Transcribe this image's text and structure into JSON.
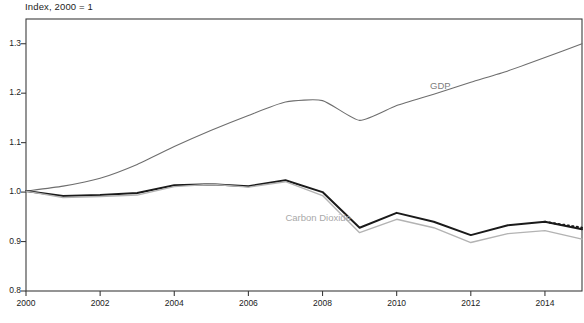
{
  "chart_data": {
    "type": "line",
    "title": "Index, 2000 = 1",
    "xlabel": "",
    "ylabel": "",
    "xlim": [
      2000,
      2015
    ],
    "ylim": [
      0.8,
      1.35
    ],
    "yticks": [
      "0.8",
      "0.9",
      "1.0",
      "1.1",
      "1.2",
      "1.3"
    ],
    "ytick_values": [
      0.8,
      0.9,
      1.0,
      1.1,
      1.2,
      1.3
    ],
    "xticks": [
      "2000",
      "2002",
      "2004",
      "2006",
      "2008",
      "2010",
      "2012",
      "2014"
    ],
    "xtick_values": [
      2000,
      2002,
      2004,
      2006,
      2008,
      2010,
      2012,
      2014
    ],
    "grid": false,
    "legend_position": "inline-annotations",
    "x": [
      2000,
      2001,
      2002,
      2003,
      2004,
      2005,
      2006,
      2007,
      2008,
      2009,
      2010,
      2011,
      2012,
      2013,
      2014,
      2015
    ],
    "series": [
      {
        "name": "GDP",
        "color": "#6e6e6e",
        "width": 1.1,
        "style": "solid",
        "values": [
          1.002,
          1.012,
          1.028,
          1.056,
          1.092,
          1.125,
          1.155,
          1.182,
          1.185,
          1.145,
          1.175,
          1.198,
          1.222,
          1.245,
          1.272,
          1.3
        ]
      },
      {
        "name": "Carbon Dioxide",
        "color": "#1a1a1a",
        "width": 2.0,
        "style": "solid",
        "values": [
          1.002,
          0.992,
          0.994,
          0.998,
          1.014,
          1.016,
          1.012,
          1.024,
          1.0,
          0.928,
          0.958,
          0.94,
          0.913,
          0.933,
          0.94,
          0.925
        ],
        "projection": {
          "style": "dotted",
          "from_x": 2014,
          "to_x": 2015,
          "values": [
            0.94,
            0.928
          ]
        }
      },
      {
        "name": "Carbon Dioxide (alternate)",
        "color": "#b3b3b3",
        "width": 1.4,
        "style": "solid",
        "values": [
          1.002,
          0.989,
          0.991,
          0.994,
          1.011,
          1.016,
          1.01,
          1.021,
          0.993,
          0.918,
          0.945,
          0.928,
          0.898,
          0.916,
          0.922,
          0.905
        ]
      }
    ],
    "annotations": [
      {
        "text": "GDP",
        "x": 2010.9,
        "y": 1.213,
        "color": "#7d7d7d"
      },
      {
        "text": "Carbon Dioxide",
        "x": 2007.0,
        "y": 0.945,
        "color": "#a9a9a9"
      }
    ]
  },
  "axis": {
    "frame_color": "#3c3c3c",
    "tick_color": "#3c3c3c"
  },
  "footnote": {
    "text": ""
  }
}
